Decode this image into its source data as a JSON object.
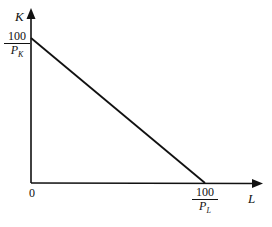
{
  "diagram": {
    "y_axis": {
      "label": "K",
      "intercept_numerator": "100",
      "intercept_denominator": "P",
      "intercept_sub": "K"
    },
    "x_axis": {
      "label": "L",
      "intercept_numerator": "100",
      "intercept_denominator": "P",
      "intercept_sub": "L"
    },
    "origin_label": "0",
    "line": {
      "from": "(0, 100/P_K)",
      "to": "(100/P_L, 0)",
      "color": "#111111"
    }
  }
}
